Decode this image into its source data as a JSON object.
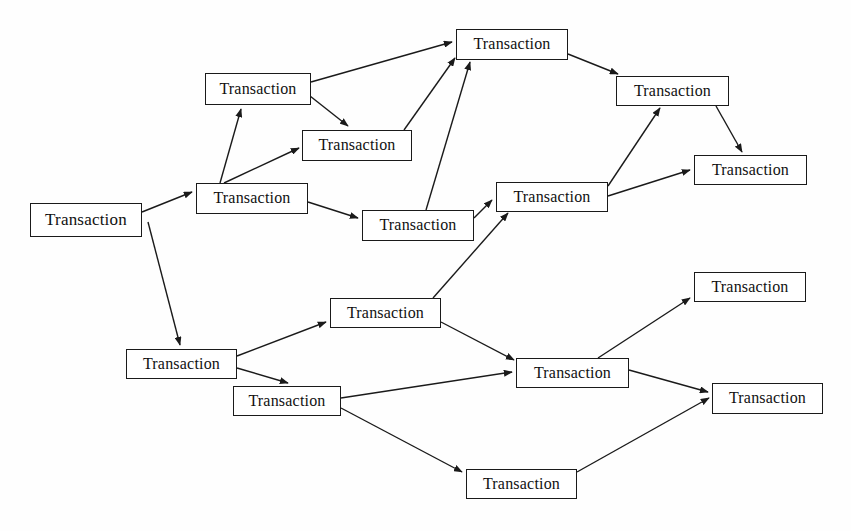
{
  "diagram": {
    "node_label": "Transaction",
    "style": {
      "background_color": "#fefefe",
      "node_fill": "#ffffff",
      "node_border_color": "#1a1a1a",
      "text_color": "#111111",
      "edge_color": "#1a1a1a"
    },
    "nodes": [
      {
        "id": "n1",
        "label": "Transaction",
        "x": 30,
        "y": 203,
        "w": 112,
        "h": 34,
        "font_size": 17
      },
      {
        "id": "n2",
        "label": "Transaction",
        "x": 205,
        "y": 73,
        "w": 106,
        "h": 32,
        "font_size": 16
      },
      {
        "id": "n3",
        "label": "Transaction",
        "x": 302,
        "y": 130,
        "w": 110,
        "h": 31,
        "font_size": 16
      },
      {
        "id": "n4",
        "label": "Transaction",
        "x": 196,
        "y": 183,
        "w": 112,
        "h": 31,
        "font_size": 16
      },
      {
        "id": "n5",
        "label": "Transaction",
        "x": 362,
        "y": 210,
        "w": 112,
        "h": 31,
        "font_size": 16
      },
      {
        "id": "n6",
        "label": "Transaction",
        "x": 456,
        "y": 29,
        "w": 112,
        "h": 31,
        "font_size": 16
      },
      {
        "id": "n7",
        "label": "Transaction",
        "x": 496,
        "y": 182,
        "w": 112,
        "h": 30,
        "font_size": 16
      },
      {
        "id": "n8",
        "label": "Transaction",
        "x": 616,
        "y": 76,
        "w": 113,
        "h": 30,
        "font_size": 16
      },
      {
        "id": "n9",
        "label": "Transaction",
        "x": 694,
        "y": 155,
        "w": 113,
        "h": 30,
        "font_size": 16
      },
      {
        "id": "n10",
        "label": "Transaction",
        "x": 126,
        "y": 349,
        "w": 111,
        "h": 30,
        "font_size": 16
      },
      {
        "id": "n11",
        "label": "Transaction",
        "x": 330,
        "y": 298,
        "w": 111,
        "h": 30,
        "font_size": 16
      },
      {
        "id": "n12",
        "label": "Transaction",
        "x": 233,
        "y": 386,
        "w": 108,
        "h": 30,
        "font_size": 16
      },
      {
        "id": "n13",
        "label": "Transaction",
        "x": 516,
        "y": 358,
        "w": 113,
        "h": 30,
        "font_size": 16
      },
      {
        "id": "n14",
        "label": "Transaction",
        "x": 694,
        "y": 272,
        "w": 112,
        "h": 30,
        "font_size": 16
      },
      {
        "id": "n15",
        "label": "Transaction",
        "x": 712,
        "y": 383,
        "w": 111,
        "h": 31,
        "font_size": 16
      },
      {
        "id": "n16",
        "label": "Transaction",
        "x": 466,
        "y": 469,
        "w": 111,
        "h": 30,
        "font_size": 16
      }
    ],
    "edges": [
      {
        "from": "n1",
        "to": "n4",
        "x1": 142,
        "y1": 212,
        "x2": 192,
        "y2": 192
      },
      {
        "from": "n1",
        "to": "n10",
        "x1": 148,
        "y1": 222,
        "x2": 180,
        "y2": 345
      },
      {
        "from": "n4",
        "to": "n2",
        "x1": 220,
        "y1": 183,
        "x2": 241,
        "y2": 109
      },
      {
        "from": "n4",
        "to": "n3",
        "x1": 224,
        "y1": 183,
        "x2": 299,
        "y2": 148
      },
      {
        "from": "n4",
        "to": "n5",
        "x1": 308,
        "y1": 202,
        "x2": 358,
        "y2": 218
      },
      {
        "from": "n2",
        "to": "n6",
        "x1": 311,
        "y1": 82,
        "x2": 452,
        "y2": 42
      },
      {
        "from": "n2",
        "to": "n3",
        "x1": 310,
        "y1": 96,
        "x2": 348,
        "y2": 126
      },
      {
        "from": "n3",
        "to": "n6",
        "x1": 404,
        "y1": 130,
        "x2": 455,
        "y2": 58
      },
      {
        "from": "n5",
        "to": "n6",
        "x1": 426,
        "y1": 210,
        "x2": 470,
        "y2": 62
      },
      {
        "from": "n5",
        "to": "n7",
        "x1": 474,
        "y1": 218,
        "x2": 492,
        "y2": 200
      },
      {
        "from": "n6",
        "to": "n8",
        "x1": 568,
        "y1": 54,
        "x2": 618,
        "y2": 74
      },
      {
        "from": "n7",
        "to": "n8",
        "x1": 608,
        "y1": 186,
        "x2": 660,
        "y2": 108
      },
      {
        "from": "n7",
        "to": "n9",
        "x1": 608,
        "y1": 196,
        "x2": 690,
        "y2": 170
      },
      {
        "from": "n8",
        "to": "n9",
        "x1": 716,
        "y1": 106,
        "x2": 742,
        "y2": 152
      },
      {
        "from": "n10",
        "to": "n11",
        "x1": 237,
        "y1": 356,
        "x2": 326,
        "y2": 322
      },
      {
        "from": "n10",
        "to": "n12",
        "x1": 237,
        "y1": 368,
        "x2": 288,
        "y2": 383
      },
      {
        "from": "n11",
        "to": "n7",
        "x1": 433,
        "y1": 298,
        "x2": 508,
        "y2": 213
      },
      {
        "from": "n11",
        "to": "n13",
        "x1": 441,
        "y1": 322,
        "x2": 514,
        "y2": 360
      },
      {
        "from": "n12",
        "to": "n13",
        "x1": 341,
        "y1": 398,
        "x2": 512,
        "y2": 372
      },
      {
        "from": "n12",
        "to": "n16",
        "x1": 341,
        "y1": 408,
        "x2": 462,
        "y2": 472
      },
      {
        "from": "n13",
        "to": "n14",
        "x1": 598,
        "y1": 358,
        "x2": 690,
        "y2": 298
      },
      {
        "from": "n13",
        "to": "n15",
        "x1": 629,
        "y1": 370,
        "x2": 708,
        "y2": 392
      },
      {
        "from": "n16",
        "to": "n15",
        "x1": 577,
        "y1": 472,
        "x2": 709,
        "y2": 398
      }
    ]
  }
}
